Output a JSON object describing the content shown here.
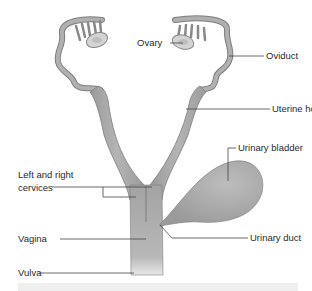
{
  "diagram": {
    "type": "anatomical-labelled",
    "colors": {
      "organ_fill": "#a9a9a9",
      "organ_stroke": "#7d7d7d",
      "leader_line": "#444444",
      "caption_bg": "#efefef"
    },
    "labels": {
      "ovary": "Ovary",
      "oviduct": "Oviduct",
      "uterine_horn": "Uterine horn",
      "urinary_bladder": "Urinary bladder",
      "cervices_line1": "Left and right",
      "cervices_line2": "cervices",
      "vagina": "Vagina",
      "urinary_duct": "Urinary duct",
      "vulva": "Vulva"
    }
  }
}
